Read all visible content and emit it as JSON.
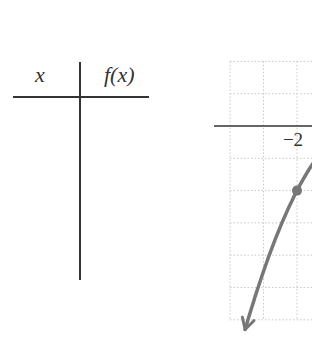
{
  "table": {
    "headers": {
      "x": "x",
      "fx": "f(x)"
    },
    "rows": [
      {
        "x": "−2",
        "fx": {
          "sign": "−",
          "whole": "2"
        }
      },
      {
        "x": "−1",
        "fx": {
          "sign": "−",
          "num": "1",
          "den": "2"
        }
      },
      {
        "x": "0",
        "fx": {
          "sign": "",
          "whole": "0"
        }
      },
      {
        "x": "1",
        "fx": {
          "sign": "−",
          "num": "1",
          "den": "2"
        }
      },
      {
        "x": "2",
        "fx": {
          "sign": "−",
          "whole": "2"
        }
      }
    ]
  },
  "chart_data": {
    "type": "line",
    "title": "",
    "xlabel": "",
    "ylabel": "",
    "function": "f(x) = -x^2/2",
    "x_tick_labels": [
      "−2"
    ],
    "x_tick_values": [
      -2
    ],
    "xlim_visible": [
      -4.5,
      -1.6
    ],
    "ylim_visible": [
      1.9,
      -6
    ],
    "grid": true,
    "grid_style": "dotted",
    "series": [
      {
        "name": "f(x)",
        "color": "#777777",
        "x": [
          -3.5,
          -3,
          -2.5,
          -2,
          -1.7
        ],
        "y": [
          -6.125,
          -4.5,
          -3.125,
          -2,
          -1.445
        ],
        "arrow_end": "bottom-left"
      }
    ],
    "points": [
      {
        "x": -2,
        "y": -2,
        "label": ""
      }
    ]
  }
}
